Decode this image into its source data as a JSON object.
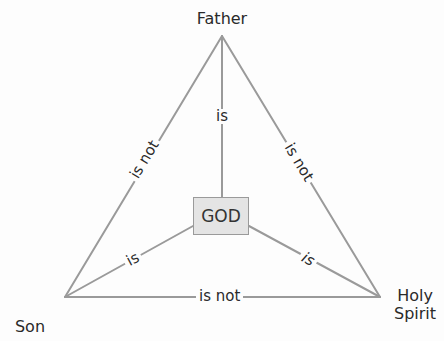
{
  "diagram": {
    "nodes": {
      "father": "Father",
      "son": "Son",
      "holy_spirit_line1": "Holy",
      "holy_spirit_line2": "Spirit",
      "god": "GOD"
    },
    "edges": {
      "father_son": "is not",
      "father_spirit": "is not",
      "son_spirit": "is not",
      "father_god": "is",
      "son_god": "is",
      "spirit_god": "is"
    },
    "colors": {
      "line": "#9a9a9a",
      "god_fill": "#e4e4e4",
      "text": "#2a2a2a"
    }
  }
}
